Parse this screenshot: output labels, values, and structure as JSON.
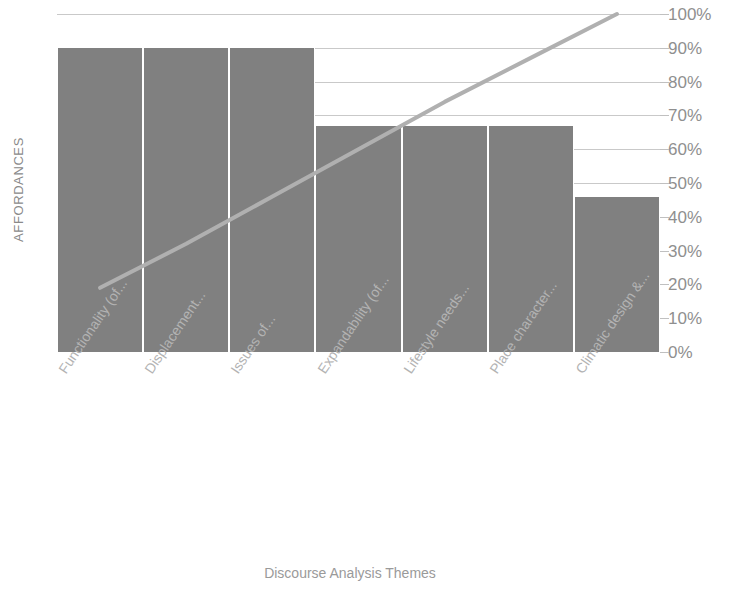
{
  "chart_data": {
    "type": "bar",
    "title": "",
    "subtitle": "",
    "xlabel": "Discourse Analysis Themes",
    "ylabel": "AFFORDANCES",
    "categories": [
      "Functionality (of...",
      "Displacement...",
      "Issues of...",
      "Expandability (of...",
      "Lifestyle needs...",
      "Place character...",
      "Climatic design &..."
    ],
    "values": [
      90,
      90,
      90,
      67,
      67,
      67,
      46
    ],
    "series": [
      {
        "name": "Affordances",
        "type": "bar",
        "values": [
          90,
          90,
          90,
          67,
          67,
          67,
          46
        ]
      },
      {
        "name": "Cumulative",
        "type": "line",
        "values": [
          19,
          32,
          46,
          60,
          74,
          87,
          100
        ]
      }
    ],
    "ylim": [
      0,
      100
    ],
    "ytick_labels": [
      "0%",
      "10%",
      "20%",
      "30%",
      "40%",
      "50%",
      "60%",
      "70%",
      "80%",
      "90%",
      "100%"
    ],
    "ytick_values": [
      0,
      10,
      20,
      30,
      40,
      50,
      60,
      70,
      80,
      90,
      100
    ],
    "yaxis_position": "right",
    "grid": true,
    "legend": "none",
    "bar_color": "#808080",
    "line_color": "#b0b0b0",
    "grid_color": "#c9c9c9",
    "label_color": "#8f8f8f",
    "axis_title_color": "#9a9a9a"
  }
}
